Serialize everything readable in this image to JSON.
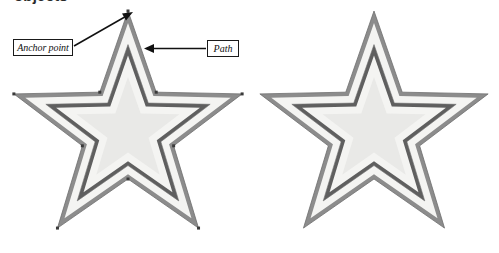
{
  "figure": {
    "heading_fragment": "objects",
    "background_color": "#ffffff",
    "annotations": [
      {
        "id": "anchor-point",
        "label": "Anchor point",
        "target": "top tip of left star outer path",
        "arrow": "diagonal arrow pointing up-right"
      },
      {
        "id": "path",
        "label": "Path",
        "target": "upper-right outer edge of left star",
        "arrow": "horizontal arrow pointing left"
      }
    ],
    "shapes": [
      {
        "id": "left-star",
        "name": "annotated-star",
        "annotated": true,
        "anchor_points_visible": true,
        "center_x": 128,
        "center_y": 131,
        "outer_radius": 120,
        "points": 5
      },
      {
        "id": "right-star",
        "name": "plain-star",
        "annotated": false,
        "anchor_points_visible": false,
        "center_x": 374,
        "center_y": 131,
        "outer_radius": 120,
        "points": 5
      }
    ],
    "colors": {
      "outer_stroke": "#8c8c8c",
      "outer_stroke_shadow": "#6f6f6f",
      "gap_fill": "#f4f4f2",
      "inner_stroke": "#727272",
      "inner_stroke_dark": "#5f5f5f",
      "core_fill": "#e9e9e7",
      "anchor_point": "#3a3a3a",
      "callout_border": "#1a1a1a",
      "callout_text": "#111111",
      "arrow": "#111111"
    }
  }
}
